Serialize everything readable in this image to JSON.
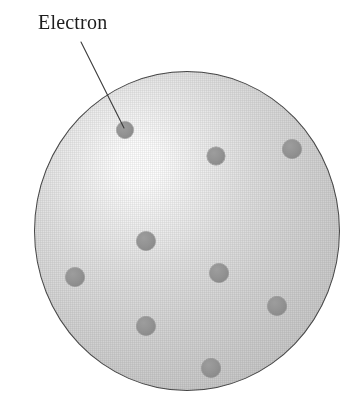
{
  "figure": {
    "background_color": "#ffffff"
  },
  "callout": {
    "label": "Electron",
    "label_x": 38,
    "label_y": 12,
    "font_size": 20,
    "text_color": "#1d1d1d",
    "leader_line": {
      "x1": 81,
      "y1": 42,
      "x2": 124,
      "y2": 128,
      "color": "#3a3a3a",
      "width": 1.1
    }
  },
  "sphere": {
    "name": "positive-charge-sphere",
    "center_x": 187,
    "center_y": 231,
    "radius_x": 153,
    "radius_y": 160,
    "fill_light": "#fdfdfd",
    "fill_mid": "#dadada",
    "fill_dark": "#c0c0c0",
    "outline_color": "#4a4a4a",
    "highlight_x_pct": 34,
    "highlight_y_pct": 29
  },
  "electrons": {
    "color": "#8e8e8e",
    "count": 9,
    "items": [
      {
        "id": "electron-1",
        "x": 125,
        "y": 130,
        "r": 8.5,
        "labeled": true
      },
      {
        "id": "electron-2",
        "x": 216,
        "y": 156,
        "r": 9.0,
        "labeled": false
      },
      {
        "id": "electron-3",
        "x": 292,
        "y": 149,
        "r": 9.5,
        "labeled": false
      },
      {
        "id": "electron-4",
        "x": 146,
        "y": 241,
        "r": 9.5,
        "labeled": false
      },
      {
        "id": "electron-5",
        "x": 75,
        "y": 277,
        "r": 9.5,
        "labeled": false
      },
      {
        "id": "electron-6",
        "x": 219,
        "y": 273,
        "r": 9.5,
        "labeled": false
      },
      {
        "id": "electron-7",
        "x": 277,
        "y": 306,
        "r": 9.5,
        "labeled": false
      },
      {
        "id": "electron-8",
        "x": 146,
        "y": 326,
        "r": 9.5,
        "labeled": false
      },
      {
        "id": "electron-9",
        "x": 211,
        "y": 368,
        "r": 9.5,
        "labeled": false
      }
    ]
  }
}
